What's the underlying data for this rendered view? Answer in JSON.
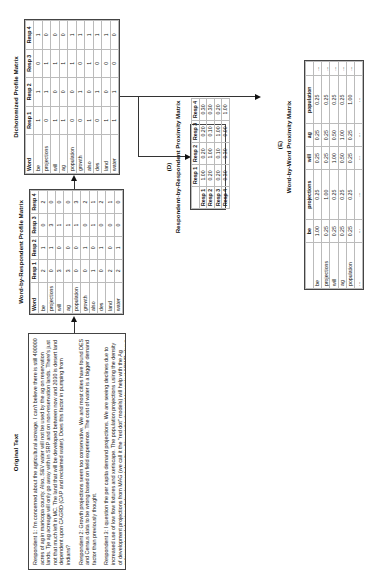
{
  "original_text": {
    "title": "Original Text",
    "paragraphs": [
      "Respondent 1: I'm concerned about the agricultural acreage. I can't believe there is still 400000 acres of ag in maricopa county. Also, S&V water will not be used by the ag on reservation lands. Tje ag acreage will only go away with in SRP and on non-reservation lands. There's just not that much left in MC. The land that will be developed between now and 2030 is desert land dependent upon CAGRD (CAP and reclaimed water). Does this factor in pumping from indians?",
      "Respondent 2: Growth projections seem too conservative. We and most cities have found DES and Census data to be wrong based on field experience. The cost of water is a bigger demand factor than previously thought.",
      "Respondent 3: I question the per capita demand projections. We are seeing declines due to increased use of low flow fixtures and xeriscape. The population projections using the density of development projections from MAG (we call it the \"red dot\" models) will help with the Ag retirement and phasing of development densities. You might also want to contact ADWR about in-state shortage sharing assumptions to get a better understanding about CAP reductions within Maricopa County in the various drought scenarios...",
      "Respondent 4: It appears to be very appropriate. Certainly easy to understand and comprehend. Though not a tecnical expert, it appears as though using historical trends and anticipating population growth and changing of land uses is a good strategy. I also like that the option to change the DES forecasts for population growth is an option. Our community is experiencing growth that is proving to cause the current DES population figures to be highly underestimated."
    ]
  },
  "word_by_respondent": {
    "title": "Word-by-Respondent Profile Matrix",
    "headers": [
      "Word",
      "Resp 1",
      "Resp 2",
      "Resp 3",
      "Resp 4"
    ],
    "rows": [
      [
        "be",
        "2",
        "1",
        "0",
        "2"
      ],
      [
        "projections",
        "0",
        "1",
        "3",
        "0"
      ],
      [
        "will",
        "3",
        "0",
        "1",
        "0"
      ],
      [
        "ag",
        "3",
        "0",
        "1",
        "0"
      ],
      [
        "population",
        "0",
        "0",
        "1",
        "3"
      ],
      [
        "growth",
        "0",
        "1",
        "0",
        "2"
      ],
      [
        "also",
        "1",
        "0",
        "1",
        "1"
      ],
      [
        "des",
        "0",
        "1",
        "0",
        "2"
      ],
      [
        "land",
        "2",
        "0",
        "0",
        "1"
      ],
      [
        "water",
        "2",
        "1",
        "0",
        "0"
      ]
    ]
  },
  "dichotomized": {
    "title": "Dichotomized Profile Matrix",
    "headers": [
      "Word",
      "Resp 1",
      "Resp 2",
      "Resp 3",
      "Resp 4"
    ],
    "rows": [
      [
        "be",
        "1",
        "1",
        "0",
        "1"
      ],
      [
        "projections",
        "0",
        "1",
        "1",
        "0"
      ],
      [
        "will",
        "1",
        "0",
        "1",
        "0"
      ],
      [
        "ag",
        "1",
        "0",
        "1",
        "0"
      ],
      [
        "population",
        "0",
        "0",
        "1",
        "1"
      ],
      [
        "growth",
        "0",
        "1",
        "0",
        "1"
      ],
      [
        "also",
        "1",
        "0",
        "1",
        "1"
      ],
      [
        "des",
        "0",
        "1",
        "0",
        "1"
      ],
      [
        "land",
        "1",
        "0",
        "0",
        "1"
      ],
      [
        "water",
        "1",
        "1",
        "0",
        "0"
      ]
    ]
  },
  "respondent_proximity": {
    "label": "(D)",
    "title": "Respondent-by-Respondent Proximity Matrix",
    "headers": [
      "",
      "Resp 1",
      "Resp 2",
      "Resp 3",
      "Resp 4"
    ],
    "rows": [
      [
        "Resp 1",
        "1.00",
        "0.20",
        "0.20",
        "0.30"
      ],
      [
        "Resp 2",
        "0.20",
        "1.00",
        "0.10",
        "0.30"
      ],
      [
        "Resp 3",
        "0.20",
        "0.10",
        "1.00",
        "0.20"
      ],
      [
        "Resp 4",
        "0.30",
        "0.30",
        "0.00",
        "1.00"
      ]
    ]
  },
  "word_proximity": {
    "label": "(E)",
    "title": "Word-by-Word Proximity Matrix",
    "headers": [
      "",
      "be",
      "projections",
      "will",
      "ag",
      "population",
      ""
    ],
    "rows": [
      [
        "be",
        "1.00",
        "0.25",
        "0.25",
        "0.25",
        "0.25",
        "..."
      ],
      [
        "projections",
        "0.25",
        "1.00",
        "0.25",
        "0.25",
        "0.25",
        "..."
      ],
      [
        "will",
        "0.25",
        "0.25",
        "1.00",
        "0.50",
        "0.25",
        "..."
      ],
      [
        "ag",
        "0.25",
        "0.25",
        "0.50",
        "1.00",
        "0.25",
        "..."
      ],
      [
        "population",
        "0.25",
        "0.25",
        "0.25",
        "0.25",
        "1.00",
        "..."
      ],
      [
        "...",
        "...",
        "...",
        "...",
        "...",
        "...",
        ""
      ]
    ]
  }
}
